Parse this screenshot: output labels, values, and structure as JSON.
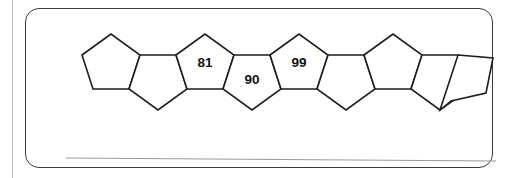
{
  "page": {
    "background_color": "#ffffff",
    "margin_rule_color": "#b9b9b9"
  },
  "problem_box": {
    "border_color": "#3a3a3a",
    "fill_color": "#ffffff",
    "corner_radius": "14"
  },
  "figure": {
    "name": "pentagon-chain",
    "shape": "regular-pentagon",
    "count": 9,
    "stroke_color": "#1d1d1d",
    "fill_color": "#ffffff",
    "orientations": [
      "up",
      "down",
      "up",
      "down",
      "up",
      "down",
      "up",
      "down",
      "down"
    ],
    "pentagons": [
      {
        "index": 1,
        "orientation": "up",
        "label": ""
      },
      {
        "index": 2,
        "orientation": "down",
        "label": ""
      },
      {
        "index": 3,
        "orientation": "up",
        "label": "81"
      },
      {
        "index": 4,
        "orientation": "down",
        "label": "90"
      },
      {
        "index": 5,
        "orientation": "up",
        "label": "99"
      },
      {
        "index": 6,
        "orientation": "down",
        "label": ""
      },
      {
        "index": 7,
        "orientation": "up",
        "label": ""
      },
      {
        "index": 8,
        "orientation": "down",
        "label": ""
      },
      {
        "index": 9,
        "orientation": "down",
        "label": ""
      }
    ],
    "visible_labels": [
      "81",
      "90",
      "99"
    ]
  },
  "answer_line": {
    "color": "#9a9a9a",
    "text": ""
  }
}
